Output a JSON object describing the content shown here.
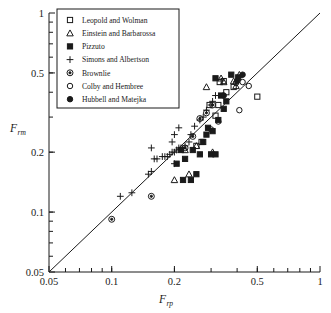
{
  "chart_data": {
    "type": "scatter",
    "title": "",
    "xlabel": "F_rp",
    "ylabel": "F_rm",
    "xscale": "log",
    "yscale": "log",
    "xlim": [
      0.05,
      1
    ],
    "ylim": [
      0.05,
      1
    ],
    "grid": false,
    "legend_position": "top-left",
    "xticklabels": [
      "0.05",
      "0.1",
      "0.2",
      "0.5",
      "1"
    ],
    "xtickvalues": [
      0.05,
      0.1,
      0.2,
      0.5,
      1
    ],
    "yticklabels": [
      "0.05",
      "0.1",
      "0.2",
      "0.5",
      "1"
    ],
    "ytickvalues": [
      0.05,
      0.1,
      0.2,
      0.5,
      1
    ],
    "reference_line": {
      "label": "1:1 line",
      "from": [
        0.05,
        0.05
      ],
      "to": [
        1,
        1
      ]
    },
    "series": [
      {
        "name": "Leopold and Wolman",
        "marker": "open-square",
        "points": [
          [
            0.295,
            0.345
          ],
          [
            0.315,
            0.305
          ],
          [
            0.325,
            0.345
          ],
          [
            0.33,
            0.45
          ],
          [
            0.345,
            0.455
          ],
          [
            0.355,
            0.4
          ],
          [
            0.385,
            0.425
          ],
          [
            0.5,
            0.38
          ],
          [
            0.255,
            0.215
          ],
          [
            0.27,
            0.225
          ]
        ]
      },
      {
        "name": "Einstein and Barbarossa",
        "marker": "open-triangle",
        "points": [
          [
            0.285,
            0.425
          ],
          [
            0.335,
            0.47
          ],
          [
            0.345,
            0.45
          ],
          [
            0.385,
            0.455
          ],
          [
            0.395,
            0.43
          ],
          [
            0.41,
            0.49
          ],
          [
            0.255,
            0.215
          ],
          [
            0.225,
            0.205
          ],
          [
            0.2,
            0.145
          ],
          [
            0.235,
            0.155
          ],
          [
            0.305,
            0.2
          ]
        ]
      },
      {
        "name": "Pizzuto",
        "marker": "filled-square",
        "points": [
          [
            0.315,
            0.47
          ],
          [
            0.375,
            0.49
          ],
          [
            0.405,
            0.475
          ],
          [
            0.335,
            0.385
          ],
          [
            0.345,
            0.33
          ],
          [
            0.355,
            0.36
          ],
          [
            0.325,
            0.29
          ],
          [
            0.305,
            0.255
          ],
          [
            0.285,
            0.245
          ],
          [
            0.3,
            0.195
          ],
          [
            0.315,
            0.195
          ],
          [
            0.265,
            0.195
          ],
          [
            0.255,
            0.155
          ],
          [
            0.225,
            0.185
          ],
          [
            0.205,
            0.175
          ],
          [
            0.245,
            0.205
          ],
          [
            0.215,
            0.205
          ],
          [
            0.24,
            0.145
          ],
          [
            0.22,
            0.145
          ],
          [
            0.29,
            0.265
          ],
          [
            0.275,
            0.225
          ]
        ]
      },
      {
        "name": "Simons and Albertson",
        "marker": "plus",
        "points": [
          [
            0.11,
            0.12
          ],
          [
            0.125,
            0.125
          ],
          [
            0.15,
            0.155
          ],
          [
            0.155,
            0.16
          ],
          [
            0.165,
            0.185
          ],
          [
            0.175,
            0.19
          ],
          [
            0.18,
            0.19
          ],
          [
            0.185,
            0.19
          ],
          [
            0.19,
            0.195
          ],
          [
            0.195,
            0.2
          ],
          [
            0.2,
            0.2
          ],
          [
            0.205,
            0.205
          ],
          [
            0.21,
            0.21
          ],
          [
            0.215,
            0.21
          ],
          [
            0.195,
            0.225
          ],
          [
            0.2,
            0.245
          ],
          [
            0.21,
            0.265
          ],
          [
            0.155,
            0.21
          ],
          [
            0.16,
            0.185
          ],
          [
            0.2,
            0.175
          ],
          [
            0.225,
            0.215
          ],
          [
            0.235,
            0.225
          ],
          [
            0.24,
            0.245
          ],
          [
            0.25,
            0.27
          ],
          [
            0.265,
            0.29
          ],
          [
            0.275,
            0.3
          ],
          [
            0.285,
            0.325
          ],
          [
            0.3,
            0.345
          ],
          [
            0.305,
            0.36
          ],
          [
            0.315,
            0.385
          ]
        ]
      },
      {
        "name": "Brownlie",
        "marker": "circle-dot",
        "points": [
          [
            0.1,
            0.092
          ],
          [
            0.155,
            0.12
          ],
          [
            0.225,
            0.21
          ],
          [
            0.265,
            0.295
          ],
          [
            0.285,
            0.315
          ],
          [
            0.305,
            0.345
          ],
          [
            0.245,
            0.24
          ]
        ]
      },
      {
        "name": "Colby and Hembree",
        "marker": "open-circle",
        "points": [
          [
            0.325,
            0.285
          ],
          [
            0.41,
            0.325
          ],
          [
            0.425,
            0.45
          ],
          [
            0.455,
            0.43
          ],
          [
            0.3,
            0.26
          ],
          [
            0.395,
            0.445
          ]
        ]
      },
      {
        "name": "Hubbell and Matejka",
        "marker": "filled-circle",
        "points": [
          [
            0.425,
            0.49
          ],
          [
            0.345,
            0.385
          ],
          [
            0.4,
            0.455
          ]
        ]
      }
    ]
  },
  "legend": {
    "items": [
      {
        "label": "Leopold and Wolman",
        "marker": "open-square"
      },
      {
        "label": "Einstein and Barbarossa",
        "marker": "open-triangle"
      },
      {
        "label": "Pizzuto",
        "marker": "filled-square"
      },
      {
        "label": "Simons and Albertson",
        "marker": "plus"
      },
      {
        "label": "Brownlie",
        "marker": "circle-dot"
      },
      {
        "label": "Colby and Hembree",
        "marker": "open-circle"
      },
      {
        "label": "Hubbell and Matejka",
        "marker": "filled-circle"
      }
    ]
  },
  "axis": {
    "x_title_main": "F",
    "x_title_sub": "rp",
    "y_title_main": "F",
    "y_title_sub": "rm"
  },
  "colors": {
    "ink": "#1a1a1a",
    "background": "#ffffff"
  }
}
